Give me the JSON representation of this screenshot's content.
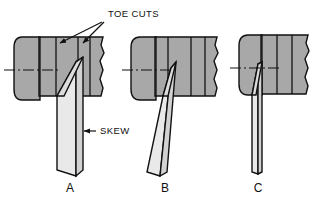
{
  "diagram": {
    "background_color": "#ffffff",
    "line_color": "#111111",
    "body_fill": "#a8a8a8",
    "blade_fill": "#e2e2e2",
    "blade_fill_dark": "#cfcfcf",
    "callouts": {
      "toe_cuts": "TOE CUTS",
      "skew": "SKEW"
    },
    "figures": [
      {
        "id": "A",
        "label": "A",
        "caption_x": 70,
        "caption_y": 191,
        "description": "Skewed blade leaning right with toe cuts at top",
        "blade_style": "skewed-wide"
      },
      {
        "id": "B",
        "label": "B",
        "caption_x": 165,
        "caption_y": 191,
        "description": "Skewed blade leaning left, narrower",
        "blade_style": "skewed-narrow"
      },
      {
        "id": "C",
        "label": "C",
        "caption_x": 258,
        "caption_y": 191,
        "description": "Straight vertical blade with no skew",
        "blade_style": "straight"
      }
    ],
    "annotations": [
      {
        "name": "toe-cuts-arrow-left",
        "from": [
          102,
          23
        ],
        "to": [
          62,
          44
        ]
      },
      {
        "name": "toe-cuts-arrow-right",
        "from": [
          104,
          23
        ],
        "to": [
          84,
          44
        ]
      },
      {
        "name": "skew-arrow",
        "from": [
          96,
          131
        ],
        "to": [
          82,
          131
        ]
      }
    ],
    "centerlines": [
      {
        "name": "centerline-a",
        "x1": 6,
        "y1": 70,
        "x2": 60,
        "y2": 70
      },
      {
        "name": "centerline-b",
        "x1": 124,
        "y1": 70,
        "x2": 172,
        "y2": 70
      },
      {
        "name": "centerline-c",
        "x1": 232,
        "y1": 68,
        "x2": 282,
        "y2": 68
      }
    ]
  }
}
